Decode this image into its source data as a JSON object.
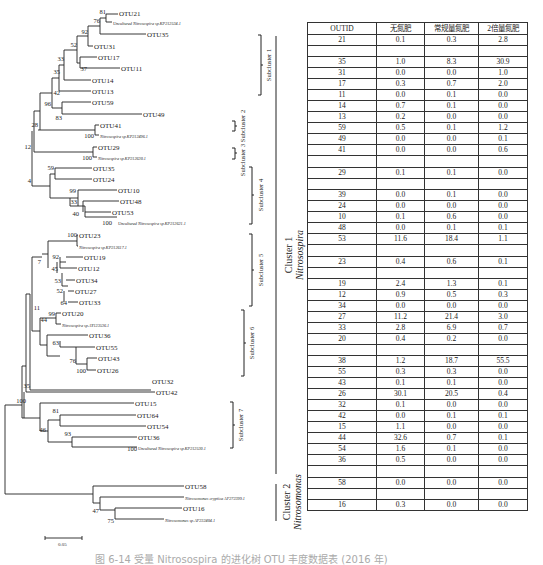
{
  "table": {
    "headers": [
      "OUTID",
      "无氮肥",
      "常规量氮肥",
      "2倍量氮肥"
    ],
    "rows": [
      [
        "21",
        "0.1",
        "0.3",
        "2.8"
      ],
      [
        "",
        "",
        "",
        ""
      ],
      [
        "35",
        "1.0",
        "8.3",
        "30.9"
      ],
      [
        "31",
        "0.0",
        "0.0",
        "1.0"
      ],
      [
        "17",
        "0.3",
        "0.7",
        "2.0"
      ],
      [
        "11",
        "0.0",
        "0.1",
        "0.0"
      ],
      [
        "14",
        "0.7",
        "0.1",
        "0.0"
      ],
      [
        "13",
        "0.2",
        "0.0",
        "0.0"
      ],
      [
        "59",
        "0.5",
        "0.1",
        "1.2"
      ],
      [
        "49",
        "0.0",
        "0.0",
        "0.1"
      ],
      [
        "41",
        "0.0",
        "0.0",
        "0.6"
      ],
      [
        "",
        "",
        "",
        ""
      ],
      [
        "29",
        "0.1",
        "0.1",
        "0.0"
      ],
      [
        "",
        "",
        "",
        ""
      ],
      [
        "39",
        "0.0",
        "0.1",
        "0.0"
      ],
      [
        "24",
        "0.0",
        "0.0",
        "0.0"
      ],
      [
        "10",
        "0.1",
        "0.6",
        "0.0"
      ],
      [
        "48",
        "0.0",
        "0.1",
        "0.1"
      ],
      [
        "53",
        "11.6",
        "18.4",
        "1.1"
      ],
      [
        "",
        "",
        "",
        ""
      ],
      [
        "23",
        "0.4",
        "0.6",
        "0.1"
      ],
      [
        "",
        "",
        "",
        ""
      ],
      [
        "19",
        "2.4",
        "1.3",
        "0.1"
      ],
      [
        "12",
        "0.9",
        "0.5",
        "0.3"
      ],
      [
        "34",
        "0.0",
        "0.0",
        "0.0"
      ],
      [
        "27",
        "11.2",
        "21.4",
        "3.0"
      ],
      [
        "33",
        "2.8",
        "6.9",
        "0.7"
      ],
      [
        "20",
        "0.4",
        "0.2",
        "0.0"
      ],
      [
        "",
        "",
        "",
        ""
      ],
      [
        "38",
        "1.2",
        "18.7",
        "55.5"
      ],
      [
        "55",
        "0.3",
        "0.3",
        "0.0"
      ],
      [
        "43",
        "0.1",
        "0.1",
        "0.0"
      ],
      [
        "26",
        "30.1",
        "20.5",
        "0.4"
      ],
      [
        "32",
        "0.1",
        "0.0",
        "0.0"
      ],
      [
        "42",
        "0.0",
        "0.1",
        "0.1"
      ],
      [
        "15",
        "1.1",
        "0.0",
        "0.0"
      ],
      [
        "44",
        "32.6",
        "0.7",
        "0.1"
      ],
      [
        "54",
        "1.6",
        "0.1",
        "0.0"
      ],
      [
        "36",
        "0.5",
        "0.0",
        "0.0"
      ],
      [
        "",
        "",
        "",
        ""
      ],
      [
        "58",
        "0.0",
        "0.0",
        "0.0"
      ],
      [
        "",
        "",
        "",
        ""
      ],
      [
        "16",
        "0.3",
        "0.0",
        "0.0"
      ]
    ]
  },
  "tree": {
    "leaves": [
      {
        "label": "OTU21",
        "y": 14,
        "x": 118
      },
      {
        "label": "Uncultured Nitrosospira sp.KP212534.1",
        "y": 22,
        "x": 100,
        "italic_part": true
      },
      {
        "label": "OTU35",
        "y": 34,
        "x": 147
      },
      {
        "label": "OTU31",
        "y": 46,
        "x": 94
      },
      {
        "label": "OTU17",
        "y": 57,
        "x": 98
      },
      {
        "label": "OTU11",
        "y": 68,
        "x": 121
      },
      {
        "label": "OTU14",
        "y": 80,
        "x": 92
      },
      {
        "label": "OTU13",
        "y": 91,
        "x": 92
      },
      {
        "label": "OTU59",
        "y": 102,
        "x": 92
      },
      {
        "label": "OTU49",
        "y": 114,
        "x": 143
      },
      {
        "label": "OTU41",
        "y": 125,
        "x": 100
      },
      {
        "label": "Nitrosospira sp.KP212496.1",
        "y": 135,
        "x": 100,
        "italic_part": true
      },
      {
        "label": "OTU29",
        "y": 147,
        "x": 98
      },
      {
        "label": "Nitrosospira sp.KP212630.1",
        "y": 157,
        "x": 98,
        "italic_part": true
      },
      {
        "label": "OTU35",
        "y": 168,
        "x": 93
      },
      {
        "label": "OTU24",
        "y": 179,
        "x": 93
      },
      {
        "label": "OTU10",
        "y": 190,
        "x": 118
      },
      {
        "label": "OTU48",
        "y": 201,
        "x": 120
      },
      {
        "label": "OTU53",
        "y": 212,
        "x": 112
      },
      {
        "label": "Uncultured Nitrosospira sp.KP212621.1",
        "y": 222,
        "x": 118,
        "italic_part": true
      },
      {
        "label": "OTU23",
        "y": 235,
        "x": 79
      },
      {
        "label": "Nitrosospira sp.KP212617.1",
        "y": 246,
        "x": 79,
        "italic_part": true
      },
      {
        "label": "OTU19",
        "y": 257,
        "x": 84
      },
      {
        "label": "OTU12",
        "y": 268,
        "x": 78
      },
      {
        "label": "OTU34",
        "y": 280,
        "x": 76
      },
      {
        "label": "OTU27",
        "y": 291,
        "x": 75
      },
      {
        "label": "OTU33",
        "y": 302,
        "x": 79
      },
      {
        "label": "OTU20",
        "y": 313,
        "x": 62
      },
      {
        "label": "Nitrosospira sp.AY123536.1",
        "y": 324,
        "x": 62,
        "italic_part": true
      },
      {
        "label": "OTU36",
        "y": 335,
        "x": 89
      },
      {
        "label": "OTU55",
        "y": 347,
        "x": 96
      },
      {
        "label": "OTU43",
        "y": 358,
        "x": 98
      },
      {
        "label": "OTU26",
        "y": 370,
        "x": 97
      },
      {
        "label": "OTU32",
        "y": 381,
        "x": 152
      },
      {
        "label": "OTU42",
        "y": 392,
        "x": 156
      },
      {
        "label": "OTU15",
        "y": 403,
        "x": 135
      },
      {
        "label": "OTU64",
        "y": 415,
        "x": 137
      },
      {
        "label": "OTU54",
        "y": 426,
        "x": 147
      },
      {
        "label": "OTU36",
        "y": 437,
        "x": 138
      },
      {
        "label": "Uncultured Nitrosospira sp.KP212530.1",
        "y": 447,
        "x": 138,
        "italic_part": true
      },
      {
        "label": "OTU58",
        "y": 486,
        "x": 185
      },
      {
        "label": "Nitrosomonas cryptica AF272399.1",
        "y": 497,
        "x": 185,
        "italic_part": true
      },
      {
        "label": "OTU16",
        "y": 508,
        "x": 183
      },
      {
        "label": "Nitrosomonas sp.AF232404.1",
        "y": 519,
        "x": 165,
        "italic_part": true
      }
    ],
    "bootstrap": [
      {
        "v": "81",
        "x": 108,
        "y": 16
      },
      {
        "v": "76",
        "x": 100,
        "y": 25
      },
      {
        "v": "92",
        "x": 83,
        "y": 36
      },
      {
        "v": "52",
        "x": 74,
        "y": 48
      },
      {
        "v": "33",
        "x": 62,
        "y": 60
      },
      {
        "v": "37",
        "x": 84,
        "y": 70
      },
      {
        "v": "35",
        "x": 61,
        "y": 74
      },
      {
        "v": "42",
        "x": 61,
        "y": 95
      },
      {
        "v": "96",
        "x": 47,
        "y": 108
      },
      {
        "v": "83",
        "x": 80,
        "y": 118
      },
      {
        "v": "28",
        "x": 39,
        "y": 123
      },
      {
        "v": "100",
        "x": 65,
        "y": 138
      },
      {
        "v": "12",
        "x": 36,
        "y": 146
      },
      {
        "v": "100",
        "x": 65,
        "y": 160
      },
      {
        "v": "59",
        "x": 67,
        "y": 171
      },
      {
        "v": "99",
        "x": 68,
        "y": 193
      },
      {
        "v": "33",
        "x": 69,
        "y": 204
      },
      {
        "v": "40",
        "x": 71,
        "y": 215
      },
      {
        "v": "4",
        "x": 37,
        "y": 205
      },
      {
        "v": "100",
        "x": 73,
        "y": 225
      },
      {
        "v": "100",
        "x": 64,
        "y": 238
      },
      {
        "v": "92",
        "x": 52,
        "y": 259
      },
      {
        "v": "45",
        "x": 52,
        "y": 271
      },
      {
        "v": "53",
        "x": 53,
        "y": 282
      },
      {
        "v": "52",
        "x": 53,
        "y": 291
      },
      {
        "v": "64",
        "x": 56,
        "y": 304
      },
      {
        "v": "7",
        "x": 35,
        "y": 263
      },
      {
        "v": "99",
        "x": 48,
        "y": 316
      },
      {
        "v": "11",
        "x": 33,
        "y": 309
      },
      {
        "v": "44",
        "x": 37,
        "y": 321
      },
      {
        "v": "63",
        "x": 42,
        "y": 343
      },
      {
        "v": "76",
        "x": 63,
        "y": 361
      },
      {
        "v": "100",
        "x": 79,
        "y": 373
      },
      {
        "v": "35",
        "x": 28,
        "y": 387
      },
      {
        "v": "100",
        "x": 16,
        "y": 414
      },
      {
        "v": "81",
        "x": 54,
        "y": 417
      },
      {
        "v": "46",
        "x": 45,
        "y": 428
      },
      {
        "v": "93",
        "x": 57,
        "y": 440
      },
      {
        "v": "100",
        "x": 100,
        "y": 450
      },
      {
        "v": "47",
        "x": 80,
        "y": 513
      },
      {
        "v": "75",
        "x": 100,
        "y": 524
      }
    ],
    "subclusters": [
      {
        "label": "Subcluster 1",
        "x": 258,
        "y1": 35,
        "y2": 95
      },
      {
        "label": "Subcluster 2",
        "x": 233,
        "y1": 118,
        "y2": 132
      },
      {
        "label": "Subcluster 3",
        "x": 233,
        "y1": 148,
        "y2": 160
      },
      {
        "label": "Subcluster 4",
        "x": 250,
        "y1": 166,
        "y2": 224
      },
      {
        "label": "Subcluster 5",
        "x": 250,
        "y1": 234,
        "y2": 306
      },
      {
        "label": "Subcluster 6",
        "x": 242,
        "y1": 310,
        "y2": 376
      },
      {
        "label": "Subcluster 7",
        "x": 231,
        "y1": 402,
        "y2": 448
      }
    ],
    "clusters": [
      {
        "label": "Cluster 1",
        "genus": "Nitrosospira",
        "x": 276,
        "y1": 36,
        "y2": 474
      },
      {
        "label": "Cluster 2",
        "genus": "Nitrosomonas",
        "x": 276,
        "y1": 484,
        "y2": 521
      }
    ],
    "scale_label": "0.05"
  },
  "caption": "图 6-14  受量 Nitrosospira 的进化树 OTU 丰度数据表 (2016 年)"
}
